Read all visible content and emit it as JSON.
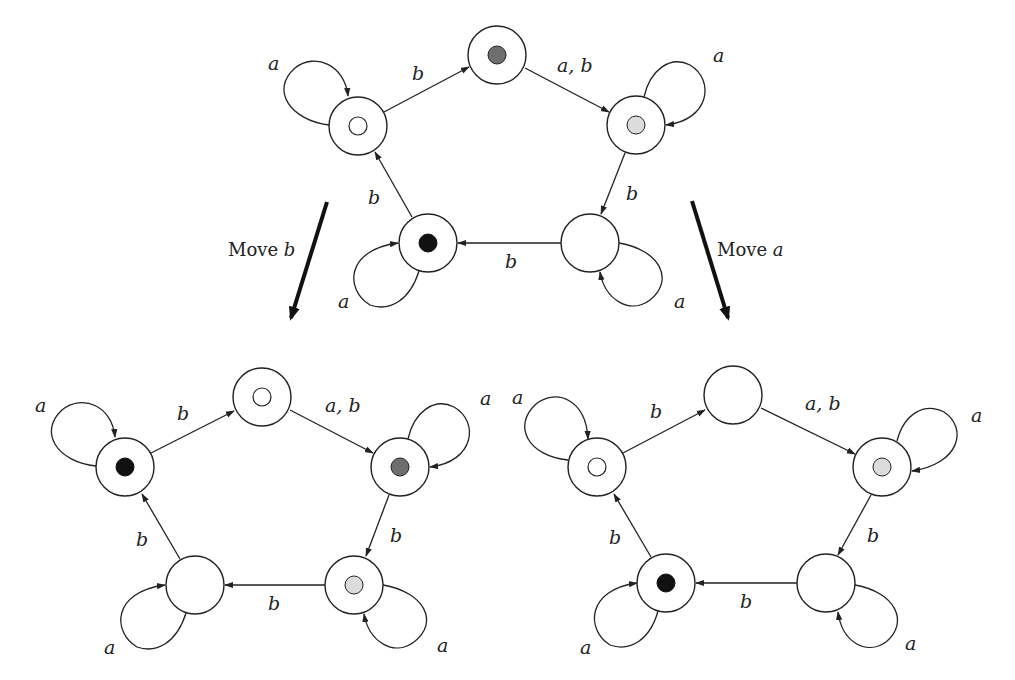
{
  "colors": {
    "white_token": "#ffffff",
    "light_token": "#dcdcdc",
    "dark_token": "#6e6e6e",
    "black_token": "#111111",
    "stroke": "#222222"
  },
  "graphs": [
    {
      "id": "top",
      "nodes": [
        {
          "id": "top",
          "x": 497,
          "y": 55,
          "token": "dark"
        },
        {
          "id": "left",
          "x": 358,
          "y": 126,
          "token": "white"
        },
        {
          "id": "right",
          "x": 636,
          "y": 125,
          "token": "light"
        },
        {
          "id": "bottom_right",
          "x": 590,
          "y": 243,
          "token": null
        },
        {
          "id": "bottom_left",
          "x": 428,
          "y": 243,
          "token": "black"
        }
      ],
      "edge_labels": {
        "left_top": "b",
        "top_right": "a, b",
        "right_br": "b",
        "br_bl": "b",
        "bl_left": "b",
        "loop_left": "a",
        "loop_right": "a",
        "loop_br": "a",
        "loop_bl": "a"
      }
    },
    {
      "id": "bottom_left",
      "nodes": [
        {
          "id": "top",
          "x": 262,
          "y": 397,
          "token": "white"
        },
        {
          "id": "left",
          "x": 125,
          "y": 467,
          "token": "black"
        },
        {
          "id": "right",
          "x": 400,
          "y": 467,
          "token": "dark"
        },
        {
          "id": "bottom_right",
          "x": 354,
          "y": 585,
          "token": "light"
        },
        {
          "id": "bottom_left",
          "x": 195,
          "y": 585,
          "token": null
        }
      ],
      "edge_labels": {
        "left_top": "b",
        "top_right": "a, b",
        "right_br": "b",
        "br_bl": "b",
        "bl_left": "b",
        "loop_left": "a",
        "loop_right": "a",
        "loop_br": "a",
        "loop_bl": "a"
      }
    },
    {
      "id": "bottom_right",
      "nodes": [
        {
          "id": "top",
          "x": 733,
          "y": 395,
          "token": null
        },
        {
          "id": "left",
          "x": 597,
          "y": 467,
          "token": "white"
        },
        {
          "id": "right",
          "x": 882,
          "y": 467,
          "token": "light"
        },
        {
          "id": "bottom_right",
          "x": 826,
          "y": 583,
          "token": null
        },
        {
          "id": "bottom_left",
          "x": 666,
          "y": 583,
          "token": "black"
        }
      ],
      "edge_labels": {
        "left_top": "b",
        "top_right": "a, b",
        "right_br": "b",
        "br_bl": "b",
        "bl_left": "b",
        "loop_left": "a",
        "loop_right": "a",
        "loop_br": "a",
        "loop_bl": "a"
      }
    }
  ],
  "transitions": {
    "move_b": {
      "prefix": "Move ",
      "letter": "b"
    },
    "move_a": {
      "prefix": "Move ",
      "letter": "a"
    }
  }
}
